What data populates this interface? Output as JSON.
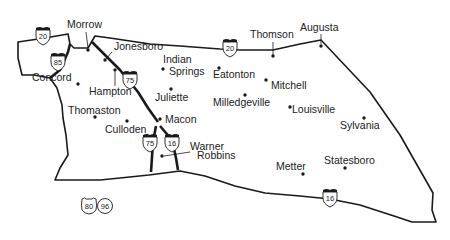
{
  "map": {
    "title": "",
    "cities": [
      {
        "name": "Morrow",
        "label_x": 67,
        "label_y": 28,
        "dot_x": 88,
        "dot_y": 50
      },
      {
        "name": "Jonesboro",
        "label_x": 114,
        "label_y": 50,
        "dot_x": 105,
        "dot_y": 60
      },
      {
        "name": "Concord",
        "label_x": 32,
        "label_y": 81,
        "dot_x": 78,
        "dot_y": 84
      },
      {
        "name": "Hampton",
        "label_x": 89,
        "label_y": 95,
        "dot_x": 115,
        "dot_y": 70
      },
      {
        "name": "Indian",
        "label_x": 163,
        "label_y": 63,
        "dot_x": null,
        "dot_y": null
      },
      {
        "name": "Springs",
        "label_x": 169,
        "label_y": 75,
        "dot_x": 163,
        "dot_y": 69
      },
      {
        "name": "Eatonton",
        "label_x": 213,
        "label_y": 78,
        "dot_x": 219,
        "dot_y": 68
      },
      {
        "name": "Thomson",
        "label_x": 250,
        "label_y": 38,
        "dot_x": 273,
        "dot_y": 56
      },
      {
        "name": "Augusta",
        "label_x": 300,
        "label_y": 31,
        "dot_x": 321,
        "dot_y": 46
      },
      {
        "name": "Mitchell",
        "label_x": 271,
        "label_y": 89,
        "dot_x": 266,
        "dot_y": 80
      },
      {
        "name": "Juliette",
        "label_x": 155,
        "label_y": 101,
        "dot_x": 171,
        "dot_y": 89
      },
      {
        "name": "Milledgeville",
        "label_x": 213,
        "label_y": 106,
        "dot_x": 245,
        "dot_y": 95
      },
      {
        "name": "Louisville",
        "label_x": 292,
        "label_y": 113,
        "dot_x": 290,
        "dot_y": 107
      },
      {
        "name": "Thomaston",
        "label_x": 68,
        "label_y": 114,
        "dot_x": 95,
        "dot_y": 117
      },
      {
        "name": "Culloden",
        "label_x": 105,
        "label_y": 133,
        "dot_x": 127,
        "dot_y": 121
      },
      {
        "name": "Macon",
        "label_x": 165,
        "label_y": 123,
        "dot_x": 160,
        "dot_y": 119
      },
      {
        "name": "Sylvania",
        "label_x": 340,
        "label_y": 129,
        "dot_x": 364,
        "dot_y": 118
      },
      {
        "name": "Warner",
        "label_x": 190,
        "label_y": 150,
        "dot_x": 162,
        "dot_y": 156
      },
      {
        "name": "Robbins",
        "label_x": 197,
        "label_y": 159,
        "dot_x": null,
        "dot_y": null
      },
      {
        "name": "Statesboro",
        "label_x": 324,
        "label_y": 164,
        "dot_x": 345,
        "dot_y": 168
      },
      {
        "name": "Metter",
        "label_x": 276,
        "label_y": 170,
        "dot_x": 303,
        "dot_y": 174
      }
    ],
    "shields": [
      {
        "type": "interstate",
        "number": "20",
        "x": 43,
        "y": 36
      },
      {
        "type": "interstate",
        "number": "85",
        "x": 58,
        "y": 62
      },
      {
        "type": "interstate",
        "number": "75",
        "x": 130,
        "y": 80
      },
      {
        "type": "interstate",
        "number": "20",
        "x": 230,
        "y": 48
      },
      {
        "type": "interstate",
        "number": "75",
        "x": 150,
        "y": 143
      },
      {
        "type": "interstate",
        "number": "16",
        "x": 172,
        "y": 143
      },
      {
        "type": "interstate",
        "number": "16",
        "x": 330,
        "y": 198
      },
      {
        "type": "us",
        "number": "80",
        "x": 89,
        "y": 206
      },
      {
        "type": "us",
        "number": "96",
        "x": 105,
        "y": 206
      }
    ]
  }
}
